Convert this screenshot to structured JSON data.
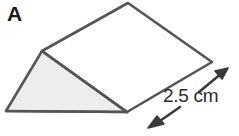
{
  "figure": {
    "shape_letter": "A",
    "shape_name": "triangular-prism",
    "dimension_label": "2.5 cm",
    "colors": {
      "outline": "#555555",
      "shaded_face_fill": "#ededed",
      "top_face_fill": "#ffffff",
      "text": "#1a1a1a",
      "background": "#ffffff",
      "arrow": "#3a3a3a"
    },
    "geometry": {
      "front_triangle": "6,111 42,51 127,112",
      "top_face": "42,51 128,3 212,62 127,112",
      "right_face": "127,112 212,62 212,62",
      "vertices": {
        "front_bottom_left": [
          6,
          111
        ],
        "front_apex": [
          42,
          51
        ],
        "front_bottom_right": [
          127,
          112
        ],
        "back_apex": [
          128,
          3
        ],
        "back_bottom_right": [
          212,
          62
        ]
      }
    },
    "arrows": [
      {
        "name": "dimension-arrow-upper-right",
        "direction": "up-right",
        "from": [
          200,
          91
        ],
        "to": [
          226,
          70
        ]
      },
      {
        "name": "dimension-arrow-lower-left",
        "direction": "down-left",
        "from": [
          178,
          108
        ],
        "to": [
          150,
          127
        ]
      }
    ]
  }
}
